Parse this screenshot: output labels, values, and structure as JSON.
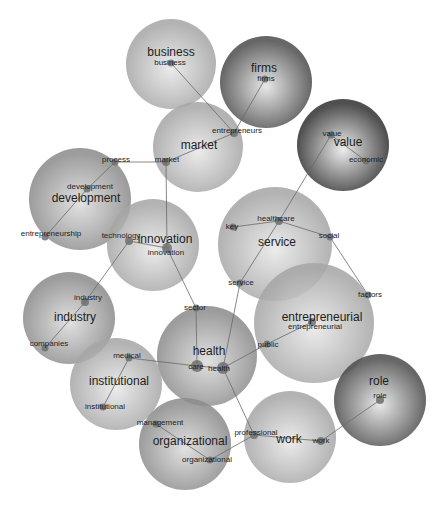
{
  "diagram": {
    "type": "term-cluster-network",
    "tone_colors": {
      "light": {
        "inner": "#e8e8e8",
        "outer": "#a6a6a6"
      },
      "medium": {
        "inner": "#dcdcdc",
        "outer": "#8c8c8c"
      },
      "dark": {
        "inner": "#e4e4e4",
        "outer": "#4e4e4e"
      },
      "darkest": {
        "inner": "#eaeaea",
        "outer": "#333333"
      }
    },
    "clusters": [
      {
        "id": "business",
        "label": "business",
        "tone": "light"
      },
      {
        "id": "firms",
        "label": "firms",
        "tone": "dark"
      },
      {
        "id": "market",
        "label": "market",
        "tone": "light"
      },
      {
        "id": "value",
        "label": "value",
        "tone": "darkest"
      },
      {
        "id": "development",
        "label": "development",
        "tone": "medium"
      },
      {
        "id": "innovation",
        "label": "innovation",
        "tone": "light"
      },
      {
        "id": "service",
        "label": "service",
        "tone": "light"
      },
      {
        "id": "entrepreneurial",
        "label": "entrepreneurial",
        "tone": "light"
      },
      {
        "id": "industry",
        "label": "industry",
        "tone": "medium"
      },
      {
        "id": "health",
        "label": "health",
        "tone": "medium"
      },
      {
        "id": "institutional",
        "label": "institutional",
        "tone": "light"
      },
      {
        "id": "organizational",
        "label": "organizational",
        "tone": "medium"
      },
      {
        "id": "work",
        "label": "work",
        "tone": "light"
      },
      {
        "id": "role",
        "label": "role",
        "tone": "dark"
      }
    ],
    "terms": [
      {
        "id": "business",
        "label": "business",
        "cluster": "business"
      },
      {
        "id": "firms",
        "label": "firms",
        "cluster": "firms"
      },
      {
        "id": "entrepreneurs",
        "label": "entrepreneurs",
        "cluster": "market"
      },
      {
        "id": "market",
        "label": "market",
        "cluster": "market"
      },
      {
        "id": "process",
        "label": "process",
        "cluster": "development"
      },
      {
        "id": "development",
        "label": "development",
        "cluster": "development"
      },
      {
        "id": "entrepreneurship",
        "label": "entrepreneurship",
        "cluster": "development"
      },
      {
        "id": "value",
        "label": "value",
        "cluster": "value"
      },
      {
        "id": "economic",
        "label": "economic",
        "cluster": "value"
      },
      {
        "id": "healthcare",
        "label": "healthcare",
        "cluster": "service"
      },
      {
        "id": "key",
        "label": "key",
        "cluster": "service"
      },
      {
        "id": "social",
        "label": "social",
        "cluster": "service"
      },
      {
        "id": "service",
        "label": "service",
        "cluster": "service"
      },
      {
        "id": "factors",
        "label": "factors",
        "cluster": "entrepreneurial"
      },
      {
        "id": "technology",
        "label": "technology",
        "cluster": "innovation"
      },
      {
        "id": "innovation",
        "label": "innovation",
        "cluster": "innovation"
      },
      {
        "id": "industry",
        "label": "industry",
        "cluster": "industry"
      },
      {
        "id": "companies",
        "label": "companies",
        "cluster": "industry"
      },
      {
        "id": "sector",
        "label": "sector",
        "cluster": "health"
      },
      {
        "id": "entrepreneurial",
        "label": "entrepreneurial",
        "cluster": "entrepreneurial"
      },
      {
        "id": "public",
        "label": "public",
        "cluster": "entrepreneurial"
      },
      {
        "id": "care",
        "label": "care",
        "cluster": "health"
      },
      {
        "id": "health",
        "label": "health",
        "cluster": "health"
      },
      {
        "id": "medical",
        "label": "medical",
        "cluster": "institutional"
      },
      {
        "id": "institutional",
        "label": "institutional",
        "cluster": "institutional"
      },
      {
        "id": "management",
        "label": "management",
        "cluster": "organizational"
      },
      {
        "id": "organizational",
        "label": "organizational",
        "cluster": "organizational"
      },
      {
        "id": "professional",
        "label": "professional",
        "cluster": "work"
      },
      {
        "id": "work",
        "label": "work",
        "cluster": "work"
      },
      {
        "id": "role",
        "label": "role",
        "cluster": "role"
      }
    ],
    "edges": [
      [
        "business",
        "entrepreneurs"
      ],
      [
        "firms",
        "entrepreneurs"
      ],
      [
        "entrepreneurs",
        "market"
      ],
      [
        "market",
        "process"
      ],
      [
        "process",
        "development"
      ],
      [
        "development",
        "entrepreneurship"
      ],
      [
        "market",
        "innovation"
      ],
      [
        "technology",
        "innovation"
      ],
      [
        "technology",
        "industry"
      ],
      [
        "industry",
        "companies"
      ],
      [
        "innovation",
        "sector"
      ],
      [
        "sector",
        "care"
      ],
      [
        "care",
        "health"
      ],
      [
        "care",
        "medical"
      ],
      [
        "medical",
        "institutional"
      ],
      [
        "health",
        "public"
      ],
      [
        "public",
        "entrepreneurial"
      ],
      [
        "health",
        "service"
      ],
      [
        "service",
        "healthcare"
      ],
      [
        "healthcare",
        "value"
      ],
      [
        "value",
        "economic"
      ],
      [
        "healthcare",
        "key"
      ],
      [
        "healthcare",
        "social"
      ],
      [
        "social",
        "factors"
      ],
      [
        "health",
        "professional"
      ],
      [
        "professional",
        "organizational"
      ],
      [
        "management",
        "organizational"
      ],
      [
        "professional",
        "work"
      ],
      [
        "work",
        "role"
      ]
    ]
  }
}
